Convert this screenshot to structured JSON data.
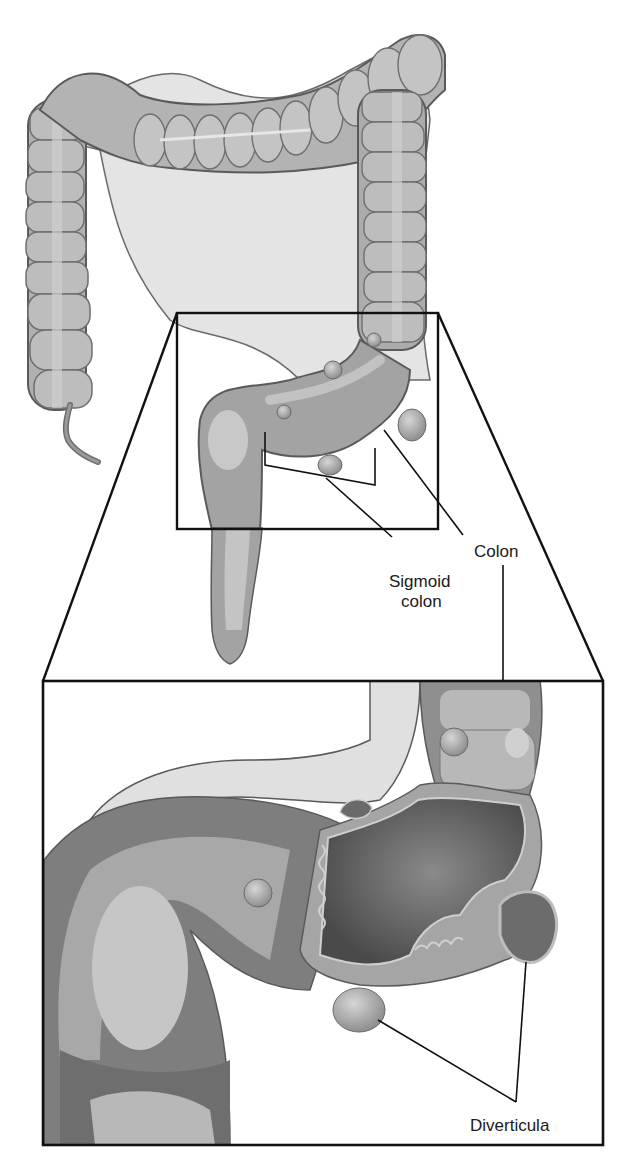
{
  "figure": {
    "labels": {
      "colon": "Colon",
      "sigmoid_line1": "Sigmoid",
      "sigmoid_line2": "colon",
      "diverticula": "Diverticula"
    },
    "palette": {
      "outline": "#5a5a5a",
      "tissue_light": "#c8c8c8",
      "tissue_mid": "#a9a9a9",
      "tissue_dark": "#7d7d7d",
      "mesentery": "#e2e2e2",
      "lumen": "#555555",
      "frame": "#111111"
    }
  }
}
